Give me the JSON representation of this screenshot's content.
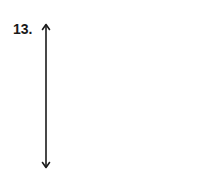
{
  "problem": {
    "number_label": "13."
  },
  "diagram": {
    "type": "vertical-double-headed-arrow",
    "stroke_color": "#1a1a1a"
  }
}
